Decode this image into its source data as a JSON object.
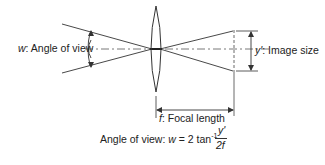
{
  "diagram": {
    "labels": {
      "angle_var": "w",
      "angle_text": ": Angle of view",
      "image_var": "y'",
      "image_text": ": Image size",
      "focal_var": "f",
      "focal_text": ": Focal length"
    },
    "formula": {
      "prefix": "Angle of view: ",
      "lhs": "w",
      "equals": " = 2 tan",
      "exponent": "-1",
      "numerator": "y'",
      "denominator": "2f"
    },
    "colors": {
      "line": "#333333",
      "background": "#ffffff"
    }
  }
}
